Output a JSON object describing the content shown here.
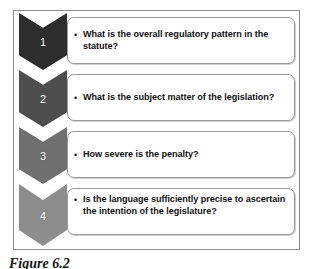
{
  "figure": {
    "caption": "Figure 6.2",
    "frame_border_color": "#8d8d8d",
    "background_color": "#ffffff"
  },
  "steps": [
    {
      "number": "1",
      "text": "What is the overall regulatory pattern in the statute?",
      "bullet": "•",
      "chevron_color": "#2d2d2d"
    },
    {
      "number": "2",
      "text": "What is the subject matter of the legislation?",
      "bullet": "•",
      "chevron_color": "#4e4e4e"
    },
    {
      "number": "3",
      "text": "How severe is the penalty?",
      "bullet": "•",
      "chevron_color": "#6f6f6f"
    },
    {
      "number": "4",
      "text": "Is the language sufficiently precise to ascertain the intention of the legislature?",
      "bullet": "•",
      "chevron_color": "#8d8d8d"
    }
  ]
}
